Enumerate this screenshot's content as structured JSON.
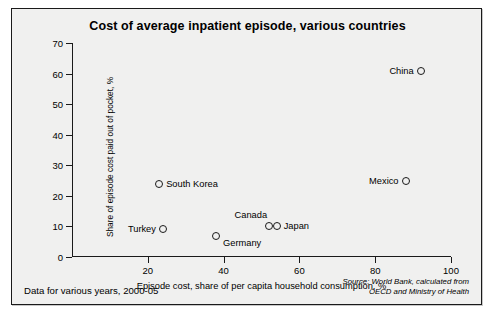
{
  "chart_data": {
    "type": "scatter",
    "title": "Cost of average inpatient episode, various countries",
    "xlabel": "Episode cost, share of per capita household consumption, %",
    "ylabel": "Share of episode cost paid out of pocket, %",
    "xlim": [
      0,
      100
    ],
    "ylim": [
      0,
      70
    ],
    "xticks": [
      20,
      40,
      60,
      80,
      100
    ],
    "yticks": [
      0,
      10,
      20,
      30,
      40,
      50,
      60,
      70
    ],
    "grid": false,
    "legend": "none",
    "marker": "open-circle",
    "points": [
      {
        "name": "China",
        "x": 92,
        "y": 61,
        "label_side": "left"
      },
      {
        "name": "Mexico",
        "x": 88,
        "y": 25,
        "label_side": "left"
      },
      {
        "name": "South Korea",
        "x": 23,
        "y": 24,
        "label_side": "right"
      },
      {
        "name": "Turkey",
        "x": 24,
        "y": 9,
        "label_side": "left"
      },
      {
        "name": "Germany",
        "x": 38,
        "y": 7,
        "label_side": "right"
      },
      {
        "name": "Canada",
        "x": 52,
        "y": 10,
        "label_side": "above"
      },
      {
        "name": "Japan",
        "x": 54,
        "y": 10,
        "label_side": "right"
      }
    ],
    "annotations": {
      "footnote": "Data for various years, 2000-05",
      "source_line1": "Source: World Bank, calculated from",
      "source_line2": "OECD and Ministry of Health"
    }
  }
}
